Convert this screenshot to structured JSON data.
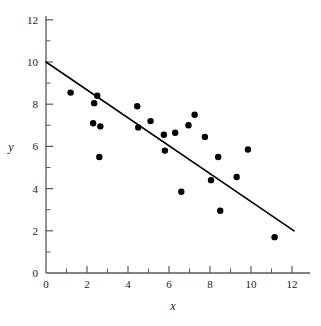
{
  "chart_data": {
    "type": "scatter",
    "title": "",
    "xlabel": "x",
    "ylabel": "y",
    "xlim": [
      0,
      12.6
    ],
    "ylim": [
      0,
      12.6
    ],
    "xticks": [
      0,
      2,
      4,
      6,
      8,
      10,
      12
    ],
    "yticks": [
      0,
      2,
      4,
      6,
      8,
      10,
      12
    ],
    "xtick_labels": [
      "0",
      "2",
      "4",
      "6",
      "8",
      "10",
      "12"
    ],
    "ytick_labels": [
      "0",
      "2",
      "4",
      "6",
      "8",
      "10",
      "12"
    ],
    "minor_tick_step": 1,
    "grid": false,
    "legend": null,
    "marker": {
      "shape": "circle",
      "color": "#000000",
      "size": 3.2
    },
    "points": [
      {
        "x": 1.2,
        "y": 8.55
      },
      {
        "x": 2.3,
        "y": 7.1
      },
      {
        "x": 2.35,
        "y": 8.05
      },
      {
        "x": 2.5,
        "y": 8.4
      },
      {
        "x": 2.65,
        "y": 6.95
      },
      {
        "x": 2.6,
        "y": 5.5
      },
      {
        "x": 4.45,
        "y": 7.9
      },
      {
        "x": 4.5,
        "y": 6.9
      },
      {
        "x": 5.1,
        "y": 7.2
      },
      {
        "x": 5.75,
        "y": 6.55
      },
      {
        "x": 5.8,
        "y": 5.8
      },
      {
        "x": 6.3,
        "y": 6.65
      },
      {
        "x": 6.6,
        "y": 3.85
      },
      {
        "x": 6.95,
        "y": 7.0
      },
      {
        "x": 7.25,
        "y": 7.5
      },
      {
        "x": 7.75,
        "y": 6.45
      },
      {
        "x": 8.05,
        "y": 4.4
      },
      {
        "x": 8.4,
        "y": 5.5
      },
      {
        "x": 8.5,
        "y": 2.95
      },
      {
        "x": 9.3,
        "y": 4.55
      },
      {
        "x": 9.85,
        "y": 5.85
      },
      {
        "x": 11.15,
        "y": 1.7
      }
    ],
    "fit_line": {
      "type": "line",
      "x_start": 0,
      "y_start": 10.0,
      "x_end": 12.1,
      "y_end": 2.0,
      "slope": -0.661,
      "intercept": 10.0,
      "color": "#000000",
      "width": 1.6
    }
  },
  "axes": {
    "color": "#595959",
    "x_axis_name": "x-axis",
    "y_axis_name": "y-axis"
  }
}
